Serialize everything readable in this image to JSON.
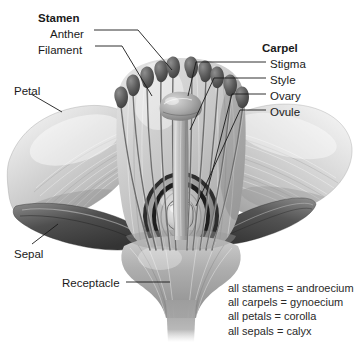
{
  "figure": {
    "type": "botanical-diagram",
    "background_color": "#ffffff",
    "ink_color": "#1a1a1a"
  },
  "labels": {
    "stamen": {
      "text": "Stamen",
      "bold": true,
      "x": 38,
      "y": 12
    },
    "anther": {
      "text": "Anther",
      "bold": false,
      "x": 50,
      "y": 28
    },
    "filament": {
      "text": "Filament",
      "bold": false,
      "x": 38,
      "y": 44
    },
    "petal": {
      "text": "Petal",
      "bold": false,
      "x": 14,
      "y": 85
    },
    "sepal": {
      "text": "Sepal",
      "bold": false,
      "x": 14,
      "y": 248
    },
    "receptacle": {
      "text": "Receptacle",
      "bold": false,
      "x": 62,
      "y": 277
    },
    "carpel": {
      "text": "Carpel",
      "bold": true,
      "x": 262,
      "y": 42
    },
    "stigma": {
      "text": "Stigma",
      "bold": false,
      "x": 270,
      "y": 58
    },
    "style": {
      "text": "Style",
      "bold": false,
      "x": 270,
      "y": 74
    },
    "ovary": {
      "text": "Ovary",
      "bold": false,
      "x": 270,
      "y": 90
    },
    "ovule": {
      "text": "Ovule",
      "bold": false,
      "x": 270,
      "y": 106
    }
  },
  "glossary": {
    "lines": [
      "all stamens = androecium",
      "all carpels = gynoecium",
      "all petals = corolla",
      "all sepals = calyx"
    ]
  },
  "parts": {
    "stamen_count": 10,
    "petal_count": 2,
    "sepal_count": 2,
    "ovule_count": 1
  }
}
